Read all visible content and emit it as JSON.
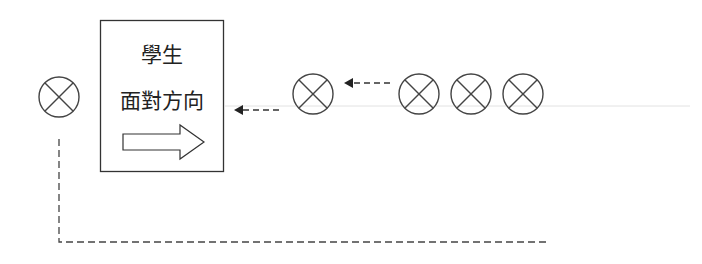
{
  "diagram": {
    "box": {
      "line1": "學生",
      "line2": "面對方向",
      "arrow_icon": "hollow-right-arrow-icon"
    },
    "symbols": {
      "circle_icon": "circled-x-icon",
      "count": 5
    },
    "colors": {
      "stroke": "#333333",
      "guide_line": "#e0e0e0",
      "background": "#ffffff"
    }
  }
}
